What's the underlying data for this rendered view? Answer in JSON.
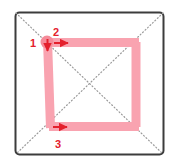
{
  "figure": {
    "canvas": {
      "width": 175,
      "height": 167,
      "background": "#ffffff"
    },
    "frame": {
      "name": "practice-box",
      "x": 15.5,
      "y": 12.5,
      "width": 148,
      "height": 142,
      "corner_radius": 4,
      "stroke_color": "#3c3c3c",
      "stroke_width": 2,
      "fill": "#ffffff"
    },
    "guides": {
      "style": "dotted",
      "color": "#9a9a9a",
      "stroke_width": 1.2,
      "dash": "1,2.4",
      "lines": [
        {
          "name": "diagonal-tl-br",
          "x1": 16,
          "y1": 13,
          "x2": 163,
          "y2": 154
        },
        {
          "name": "diagonal-tr-bl",
          "x1": 163,
          "y1": 13,
          "x2": 16,
          "y2": 154
        }
      ],
      "center": {
        "x": 89.5,
        "y": 83.5
      }
    },
    "strokes": {
      "color": "#f9a3b0",
      "width": 9,
      "linecap": "butt",
      "items": [
        {
          "name": "stroke-left-vertical",
          "order": 1,
          "x1": 47.5,
          "y1": 40,
          "x2": 50.5,
          "y2": 128
        },
        {
          "name": "stroke-top-horizontal",
          "order": 2,
          "x1": 46,
          "y1": 42.5,
          "x2": 139,
          "y2": 42.5
        },
        {
          "name": "stroke-bottom-horizontal",
          "order": 3,
          "x1": 49,
          "y1": 126.5,
          "x2": 139,
          "y2": 126.5
        },
        {
          "name": "stroke-right-vertical",
          "order": 4,
          "x1": 136,
          "y1": 42,
          "x2": 136,
          "y2": 127
        }
      ]
    },
    "start_dot": {
      "name": "start-point-dot",
      "cx": 47,
      "cy": 42,
      "r": 6.5,
      "color": "#f58b99"
    },
    "annotations": {
      "color": "#e4202c",
      "items": [
        {
          "name": "step-label-1",
          "text": "1",
          "x": 33,
          "y": 47,
          "arrow": {
            "name": "arrow-down-stroke-1",
            "direction": "down",
            "x1": 47.5,
            "y1": 39,
            "x2": 47.5,
            "y2": 51
          }
        },
        {
          "name": "step-label-2",
          "text": "2",
          "x": 56,
          "y": 36,
          "arrow": {
            "name": "arrow-right-stroke-2",
            "direction": "right",
            "x1": 54,
            "y1": 43,
            "x2": 68,
            "y2": 43
          }
        },
        {
          "name": "step-label-3",
          "text": "3",
          "x": 58,
          "y": 148,
          "arrow": {
            "name": "arrow-right-stroke-3",
            "direction": "right",
            "x1": 53,
            "y1": 127,
            "x2": 67,
            "y2": 127
          }
        }
      ]
    }
  }
}
